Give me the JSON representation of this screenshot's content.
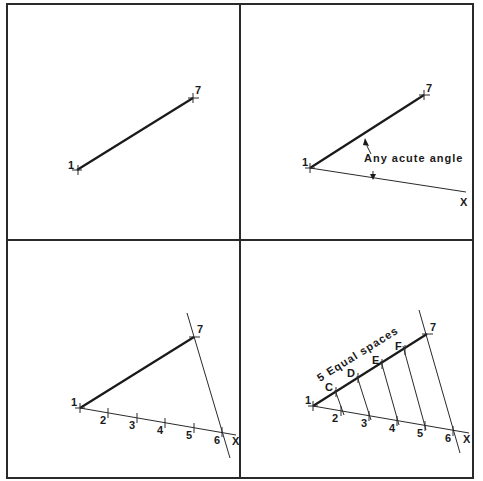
{
  "panels": [
    {
      "id": "step-1",
      "points": {
        "start": "1",
        "end": "7"
      }
    },
    {
      "id": "step-2",
      "points": {
        "start": "1",
        "end": "7",
        "ray": "X"
      },
      "annotation": "Any acute angle"
    },
    {
      "id": "step-3",
      "points": {
        "start": "1",
        "end": "7",
        "ray": "X"
      },
      "divisions": [
        "2",
        "3",
        "4",
        "5",
        "6"
      ]
    },
    {
      "id": "step-4",
      "points": {
        "start": "1",
        "end": "7",
        "ray": "X"
      },
      "divisions": [
        "2",
        "3",
        "4",
        "5",
        "6"
      ],
      "line_points": [
        "C",
        "D",
        "E",
        "F"
      ],
      "annotation": "5 Equal spaces"
    }
  ]
}
